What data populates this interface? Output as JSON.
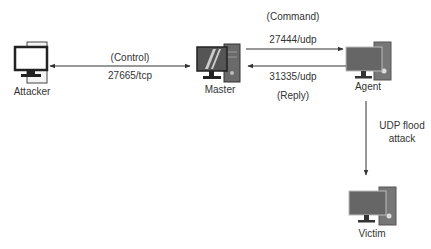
{
  "diagram": {
    "nodes": {
      "attacker": {
        "label": "Attacker"
      },
      "master": {
        "label": "Master"
      },
      "agent": {
        "label": "Agent"
      },
      "victim": {
        "label": "Victim"
      }
    },
    "edges": {
      "attacker_master": {
        "top_label": "(Control)",
        "bottom_label": "27665/tcp",
        "direction": "bidirectional"
      },
      "master_agent_command": {
        "top_label": "(Command)",
        "port_label": "27444/udp",
        "direction": "master-to-agent"
      },
      "agent_master_reply": {
        "port_label": "31335/udp",
        "bottom_label": "(Reply)",
        "direction": "agent-to-master"
      },
      "agent_victim": {
        "label_line1": "UDP flood",
        "label_line2": "attack",
        "direction": "agent-to-victim"
      }
    },
    "colors": {
      "line": "#333333",
      "monitor_dark": "#555555",
      "tower_gray": "#777777",
      "background": "#ffffff"
    }
  }
}
